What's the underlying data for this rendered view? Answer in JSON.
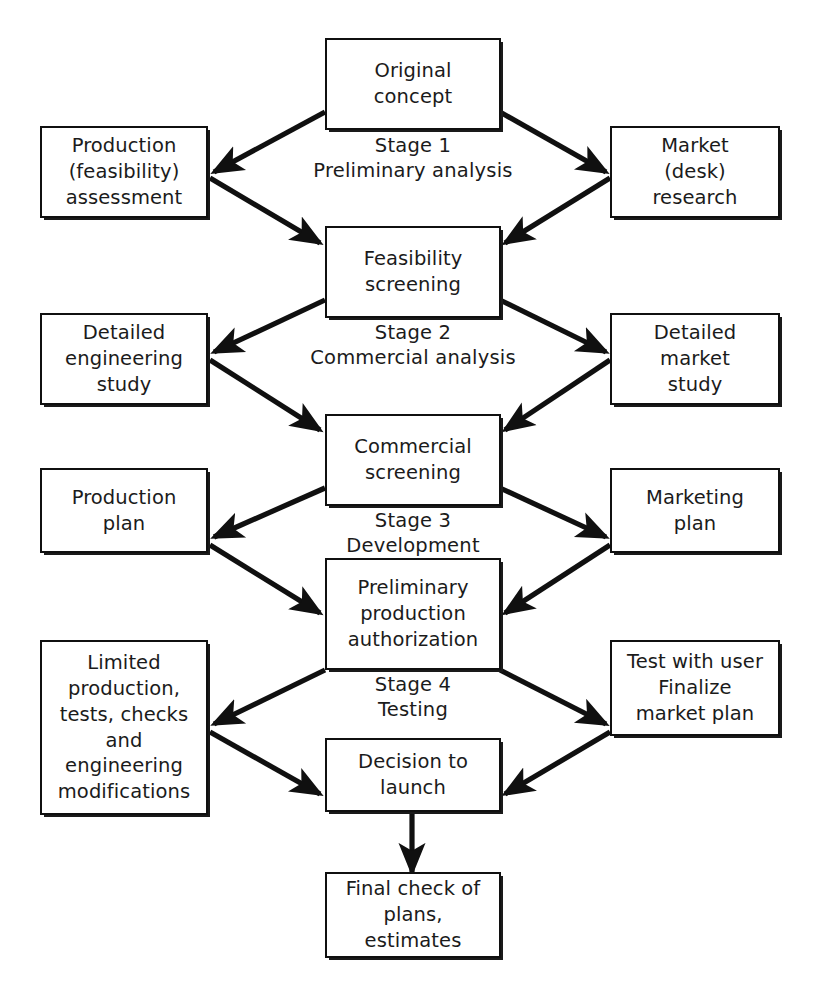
{
  "diagram": {
    "line_color": "#101010",
    "box_fill": "#ffffff",
    "nodes": {
      "original_concept": "Original\nconcept",
      "production_feasibility_assessment": "Production\n(feasibility)\nassessment",
      "market_desk_research": "Market\n(desk)\nresearch",
      "feasibility_screening": "Feasibility\nscreening",
      "detailed_engineering_study": "Detailed\nengineering\nstudy",
      "detailed_market_study": "Detailed\nmarket\nstudy",
      "commercial_screening": "Commercial\nscreening",
      "production_plan": "Production\nplan",
      "marketing_plan": "Marketing\nplan",
      "preliminary_production_authorization": "Preliminary\nproduction\nauthorization",
      "limited_production": "Limited\nproduction,\ntests, checks\nand\nengineering\nmodifications",
      "test_with_user": "Test with user\nFinalize\nmarket plan",
      "decision_to_launch": "Decision to\nlaunch",
      "final_check": "Final check of\nplans, estimates"
    },
    "stages": {
      "stage1": "Stage 1\nPreliminary  analysis",
      "stage2": "Stage 2\nCommercial analysis",
      "stage3": "Stage  3\nDevelopment",
      "stage4": "Stage 4\nTesting"
    }
  }
}
